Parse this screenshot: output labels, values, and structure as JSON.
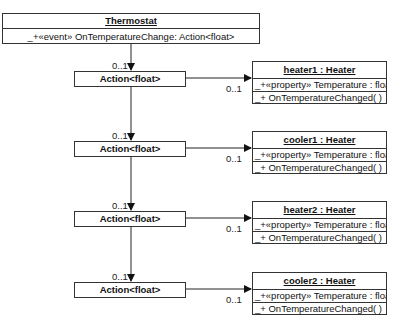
{
  "thermostat": {
    "title": "Thermostat",
    "title_underline_char": "T",
    "member": "_+«event» OnTemperatureChange: Action<float>"
  },
  "actions": [
    {
      "label": "Action<float>",
      "in_mult": "0..1",
      "out_mult": "0..1"
    },
    {
      "label": "Action<float>",
      "in_mult": "0..1",
      "out_mult": "0..1"
    },
    {
      "label": "Action<float>",
      "in_mult": "0..1",
      "out_mult": "0..1"
    },
    {
      "label": "Action<float>",
      "in_mult": "0..1",
      "out_mult": "0..1"
    }
  ],
  "heaters": [
    {
      "title": "heater1 : Heater",
      "property": "_+«property» Temperature : float",
      "method": "_+ OnTemperatureChanged( )"
    },
    {
      "title": "cooler1 : Heater",
      "property": "_+«property» Temperature : float",
      "method": "_+ OnTemperatureChanged( )"
    },
    {
      "title": "heater2 : Heater",
      "property": "_+«property» Temperature : float",
      "method": "_+ OnTemperatureChanged( )"
    },
    {
      "title": "cooler2 : Heater",
      "property": "_+«property» Temperature : float",
      "method": "_+ OnTemperatureChanged( )"
    }
  ]
}
